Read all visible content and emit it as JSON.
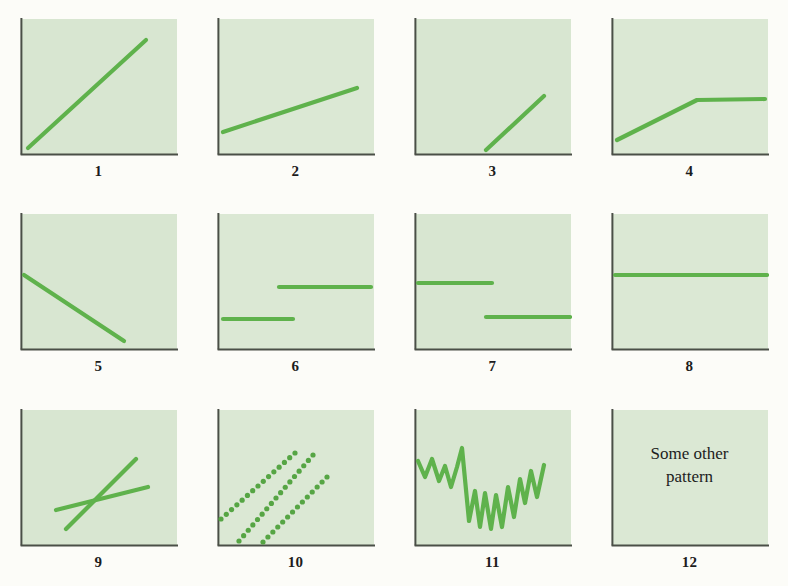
{
  "figure": {
    "background_color": "#fcfcf8",
    "panel_fill": "#d8e6d1",
    "panel_fill_alt": "#dbe8d4",
    "axis_color": "#4a4f47",
    "line_color": "#5fb24c",
    "line_color_dark": "#56a544",
    "label_color": "#1c1c1c",
    "panel_width": 158,
    "panel_height": 138,
    "line_width": 4.2,
    "columns": 4,
    "rows": 3
  },
  "panels": [
    {
      "id": "1",
      "label": "1",
      "kind": "line",
      "description": "steep straight rising line from origin",
      "points": [
        [
          8,
          130
        ],
        [
          126,
          22
        ]
      ]
    },
    {
      "id": "2",
      "label": "2",
      "kind": "line",
      "description": "shallow straight rising line",
      "points": [
        [
          6,
          114
        ],
        [
          140,
          70
        ]
      ]
    },
    {
      "id": "3",
      "label": "3",
      "kind": "line",
      "description": "rising line beginning partway along the x-axis",
      "points": [
        [
          72,
          132
        ],
        [
          130,
          78
        ]
      ]
    },
    {
      "id": "4",
      "label": "4",
      "kind": "polyline",
      "description": "rising ramp then flat plateau",
      "points": [
        [
          6,
          122
        ],
        [
          86,
          82
        ],
        [
          154,
          81
        ]
      ]
    },
    {
      "id": "5",
      "label": "5",
      "kind": "line",
      "description": "falling straight line reaching the x-axis",
      "points": [
        [
          4,
          62
        ],
        [
          104,
          128
        ]
      ]
    },
    {
      "id": "6",
      "label": "6",
      "kind": "segments",
      "description": "step up: low level then high level",
      "segments": [
        [
          [
            6,
            106
          ],
          [
            76,
            106
          ]
        ],
        [
          [
            62,
            74
          ],
          [
            154,
            74
          ]
        ]
      ]
    },
    {
      "id": "7",
      "label": "7",
      "kind": "segments",
      "description": "step down: high level then low level",
      "segments": [
        [
          [
            4,
            70
          ],
          [
            78,
            70
          ]
        ],
        [
          [
            72,
            104
          ],
          [
            156,
            104
          ]
        ]
      ]
    },
    {
      "id": "8",
      "label": "8",
      "kind": "line",
      "description": "flat horizontal line across full width",
      "points": [
        [
          4,
          62
        ],
        [
          156,
          62
        ]
      ]
    },
    {
      "id": "9",
      "label": "9",
      "kind": "multiline",
      "description": "two crossing lines, one steep one shallow",
      "lines": [
        [
          [
            36,
            101
          ],
          [
            128,
            78
          ]
        ],
        [
          [
            46,
            120
          ],
          [
            116,
            50
          ]
        ]
      ]
    },
    {
      "id": "10",
      "label": "10",
      "kind": "dotted",
      "description": "three parallel dotted rising lines",
      "lines": [
        [
          [
            4,
            110
          ],
          [
            78,
            44
          ]
        ],
        [
          [
            22,
            132
          ],
          [
            96,
            46
          ]
        ],
        [
          [
            46,
            133
          ],
          [
            110,
            68
          ]
        ]
      ],
      "dot_radius": 2.6,
      "dot_spacing": 7.0
    },
    {
      "id": "11",
      "label": "11",
      "kind": "zigzag",
      "description": "volatile jagged series falling then recovering",
      "points": [
        [
          4,
          52
        ],
        [
          11,
          68
        ],
        [
          18,
          50
        ],
        [
          25,
          72
        ],
        [
          31,
          57
        ],
        [
          37,
          78
        ],
        [
          43,
          58
        ],
        [
          48,
          39
        ],
        [
          55,
          112
        ],
        [
          61,
          82
        ],
        [
          66,
          118
        ],
        [
          71,
          84
        ],
        [
          77,
          120
        ],
        [
          82,
          86
        ],
        [
          88,
          118
        ],
        [
          94,
          78
        ],
        [
          100,
          108
        ],
        [
          106,
          70
        ],
        [
          111,
          94
        ],
        [
          117,
          62
        ],
        [
          123,
          88
        ],
        [
          130,
          56
        ]
      ]
    },
    {
      "id": "12",
      "label": "12",
      "kind": "text",
      "description": "placeholder text panel",
      "text_lines": [
        "Some other",
        "pattern"
      ]
    }
  ]
}
